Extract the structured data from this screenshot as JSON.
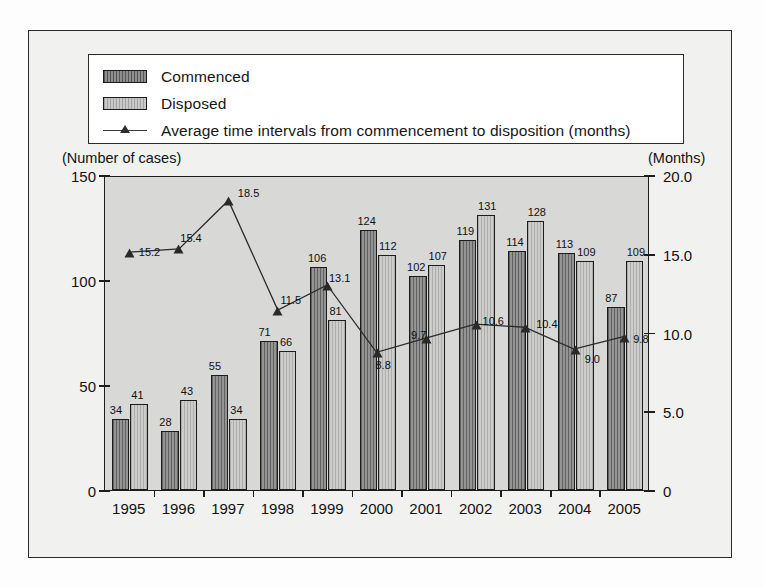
{
  "legend": {
    "items": [
      {
        "label": "Commenced",
        "type": "bar-swatch",
        "style": "commenced"
      },
      {
        "label": "Disposed",
        "type": "bar-swatch",
        "style": "disposed"
      },
      {
        "label": "Average time intervals from commencement to disposition (months)",
        "type": "line-swatch",
        "style": "line"
      }
    ]
  },
  "axis_captions": {
    "left": "(Number of cases)",
    "right": "(Months)"
  },
  "chart_data": {
    "type": "bar",
    "title": "",
    "subtitle": "",
    "xlabel": "",
    "ylabel": "(Number of cases)",
    "y2label": "(Months)",
    "grid": false,
    "legend_position": "top",
    "categories": [
      "1995",
      "1996",
      "1997",
      "1998",
      "1999",
      "2000",
      "2001",
      "2002",
      "2003",
      "2004",
      "2005"
    ],
    "ylim": [
      0,
      150
    ],
    "yticks": [
      "0",
      "50",
      "100",
      "150"
    ],
    "ytick_values": [
      0,
      50,
      100,
      150
    ],
    "y2lim": [
      0,
      20.0
    ],
    "y2ticks": [
      "0",
      "5.0",
      "10.0",
      "15.0",
      "20.0"
    ],
    "y2tick_values": [
      0,
      5,
      10,
      15,
      20
    ],
    "series": [
      {
        "name": "Commenced",
        "kind": "bar",
        "axis": "left",
        "values": [
          34,
          28,
          55,
          71,
          106,
          124,
          102,
          119,
          114,
          113,
          87
        ],
        "labels": [
          "34",
          "28",
          "55",
          "71",
          "106",
          "124",
          "102",
          "119",
          "114",
          "113",
          "87"
        ]
      },
      {
        "name": "Disposed",
        "kind": "bar",
        "axis": "left",
        "values": [
          41,
          43,
          34,
          66,
          81,
          112,
          107,
          131,
          128,
          109,
          109
        ],
        "labels": [
          "41",
          "43",
          "34",
          "66",
          "81",
          "112",
          "107",
          "131",
          "128",
          "109",
          "109"
        ]
      },
      {
        "name": "Average time intervals from commencement to disposition (months)",
        "kind": "line",
        "axis": "right",
        "values": [
          15.2,
          15.4,
          18.5,
          11.5,
          13.1,
          8.8,
          9.7,
          10.6,
          10.4,
          9.0,
          9.8
        ],
        "labels": [
          "15.2",
          "15.4",
          "18.5",
          "11.5",
          "13.1",
          "8.8",
          "9.7",
          "10.6",
          "10.4",
          "9.0",
          "9.8"
        ]
      }
    ]
  },
  "colors": {
    "commenced_bar": "#949494",
    "disposed_bar": "#cdcdcb",
    "line": "#2a2a2a",
    "plot_background": "#d8d8d6",
    "frame_background": "#f1f1f0",
    "axis": "#1d1d1d"
  }
}
